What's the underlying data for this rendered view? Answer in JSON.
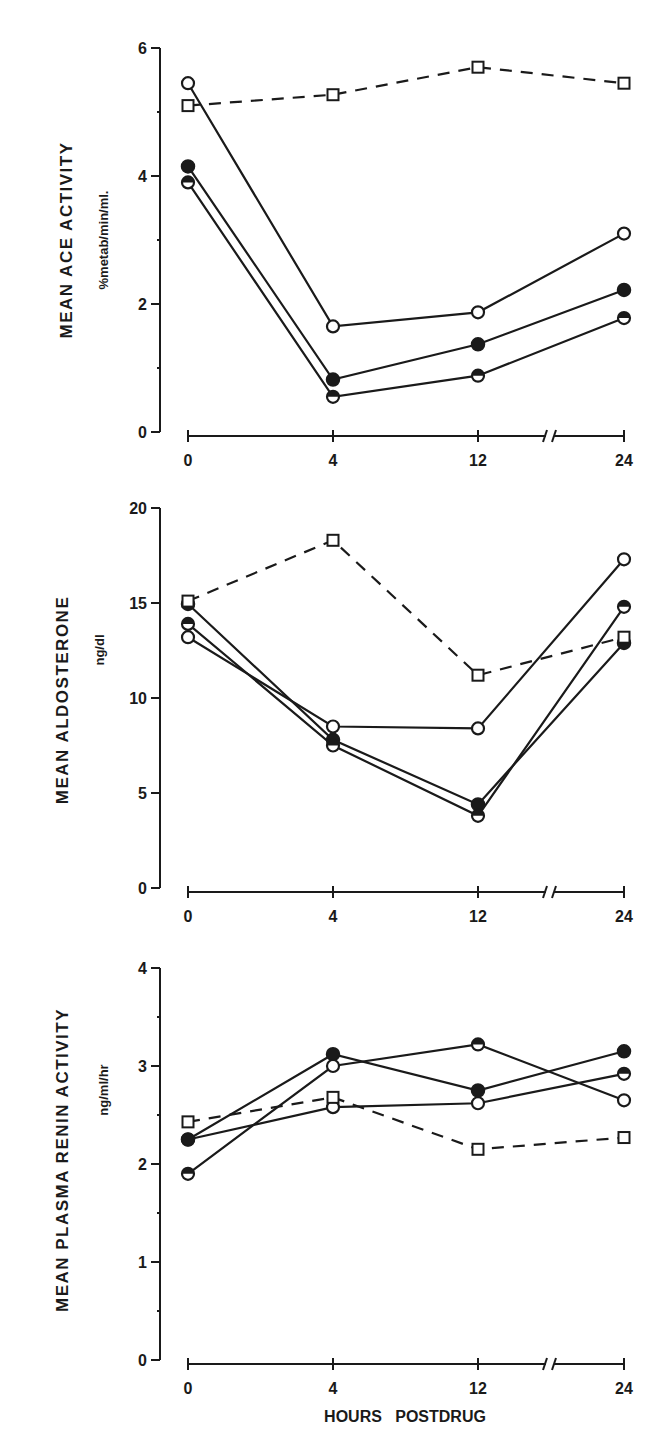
{
  "chart_data": [
    {
      "type": "line",
      "title": "",
      "ylabel": "MEAN ACE ACTIVITY",
      "yunit": "%metab/min/ml.",
      "xlabel": "",
      "x": [
        0,
        4,
        12,
        24
      ],
      "x_tick_labels": [
        "0",
        "4",
        "12",
        "24"
      ],
      "x_axis_break": "between 12 and 24",
      "ylim": [
        0,
        6
      ],
      "y_ticks": [
        0,
        2,
        4,
        6
      ],
      "y_minor_ticks": [
        1,
        3,
        5
      ],
      "grid": false,
      "series": [
        {
          "name": "open-circle",
          "marker": "open-circle",
          "line": "solid",
          "values": [
            5.45,
            1.65,
            1.87,
            3.1
          ]
        },
        {
          "name": "filled-circle",
          "marker": "filled-circle",
          "line": "solid",
          "values": [
            4.15,
            0.82,
            1.37,
            2.22
          ]
        },
        {
          "name": "half-filled-circle",
          "marker": "half-filled-circle",
          "line": "solid",
          "values": [
            3.9,
            0.55,
            0.88,
            1.78
          ]
        },
        {
          "name": "open-square",
          "marker": "open-square",
          "line": "dashed",
          "values": [
            5.1,
            5.27,
            5.7,
            5.45
          ]
        }
      ]
    },
    {
      "type": "line",
      "title": "",
      "ylabel": "MEAN ALDOSTERONE",
      "yunit": "ng/dl",
      "xlabel": "",
      "x": [
        0,
        4,
        12,
        24
      ],
      "x_tick_labels": [
        "0",
        "4",
        "12",
        "24"
      ],
      "x_axis_break": "between 12 and 24",
      "ylim": [
        0,
        20
      ],
      "y_ticks": [
        0,
        5,
        10,
        15,
        20
      ],
      "grid": false,
      "series": [
        {
          "name": "open-circle",
          "marker": "open-circle",
          "line": "solid",
          "values": [
            13.2,
            8.5,
            8.4,
            17.3
          ]
        },
        {
          "name": "filled-circle",
          "marker": "filled-circle",
          "line": "solid",
          "values": [
            14.95,
            7.8,
            4.4,
            12.9
          ]
        },
        {
          "name": "half-filled-circle",
          "marker": "half-filled-circle",
          "line": "solid",
          "values": [
            13.9,
            7.5,
            3.8,
            14.8
          ]
        },
        {
          "name": "open-square",
          "marker": "open-square",
          "line": "dashed",
          "values": [
            15.1,
            18.3,
            11.2,
            13.2
          ]
        }
      ]
    },
    {
      "type": "line",
      "title": "",
      "ylabel": "MEAN PLASMA RENIN ACTIVITY",
      "yunit": "ng/ml/hr",
      "xlabel": "HOURS  POSTDRUG",
      "x": [
        0,
        4,
        12,
        24
      ],
      "x_tick_labels": [
        "0",
        "4",
        "12",
        "24"
      ],
      "x_axis_break": "between 12 and 24",
      "ylim": [
        0,
        4
      ],
      "y_ticks": [
        0,
        1,
        2,
        3,
        4
      ],
      "y_minor_ticks": [
        0.5,
        1.5,
        2.5,
        3.5
      ],
      "grid": false,
      "series": [
        {
          "name": "open-circle",
          "marker": "open-circle",
          "line": "solid",
          "values": [
            2.25,
            2.58,
            2.62,
            2.92
          ],
          "markers_per_point": [
            "open-circle",
            "open-circle",
            "open-circle",
            "half-filled-circle"
          ]
        },
        {
          "name": "filled-circle",
          "marker": "filled-circle",
          "line": "solid",
          "values": [
            2.25,
            3.12,
            2.75,
            3.15
          ]
        },
        {
          "name": "half-filled-circle",
          "marker": "half-filled-circle",
          "line": "solid",
          "values": [
            1.9,
            3.0,
            3.22,
            2.65
          ],
          "markers_per_point": [
            "half-filled-circle",
            "open-circle",
            "half-filled-circle",
            "open-circle"
          ]
        },
        {
          "name": "open-square",
          "marker": "open-square",
          "line": "dashed",
          "values": [
            2.43,
            2.68,
            2.15,
            2.27
          ]
        }
      ]
    }
  ],
  "figure": {
    "ink_color": "#1a1a1a",
    "background": "#ffffff",
    "panels": [
      {
        "ylabel": "MEAN ACE ACTIVITY",
        "yunit": "%metab/min/ml.",
        "tick_labels": [
          "0",
          "2",
          "4",
          "6"
        ],
        "x_labels": [
          "0",
          "4",
          "12",
          "24"
        ]
      },
      {
        "ylabel": "MEAN ALDOSTERONE",
        "yunit": "ng/dl",
        "tick_labels": [
          "0",
          "5",
          "10",
          "15",
          "20"
        ],
        "x_labels": [
          "0",
          "4",
          "12",
          "24"
        ]
      },
      {
        "ylabel": "MEAN PLASMA RENIN ACTIVITY",
        "yunit": "ng/ml/hr",
        "tick_labels": [
          "0",
          "1",
          "2",
          "3",
          "4"
        ],
        "x_labels": [
          "0",
          "4",
          "12",
          "24"
        ]
      }
    ],
    "xlabel": "HOURS  POSTDRUG"
  }
}
